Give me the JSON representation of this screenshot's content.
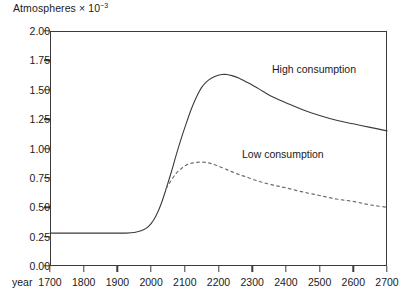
{
  "chart_data": {
    "type": "line",
    "title_base": "Atmospheres × 10",
    "title_exponent": "−3",
    "xlabel": "year",
    "ylabel": "Atmospheres × 10⁻³",
    "xlim": [
      1700,
      2700
    ],
    "ylim": [
      0.0,
      2.0
    ],
    "grid": false,
    "legend_position": "inline-annotations",
    "xticks": [
      1700,
      1800,
      1900,
      2000,
      2100,
      2200,
      2300,
      2400,
      2500,
      2600,
      2700
    ],
    "xtick_labels": [
      "1700",
      "1800",
      "1900",
      "2000",
      "2100",
      "2200",
      "2300",
      "2400",
      "2500",
      "2600",
      "2700"
    ],
    "yticks": [
      0.0,
      0.25,
      0.5,
      0.75,
      1.0,
      1.25,
      1.5,
      1.75,
      2.0
    ],
    "ytick_labels": [
      "0.00",
      "0.25",
      "0.50",
      "0.75",
      "1.00",
      "1.25",
      "1.50",
      "1.75",
      "2.00"
    ],
    "series": [
      {
        "name": "High consumption",
        "style": "solid",
        "color": "#3b3b3b",
        "annotation": "High consumption",
        "x": [
          1700,
          1750,
          1800,
          1850,
          1900,
          1925,
          1950,
          1970,
          1985,
          2000,
          2015,
          2030,
          2045,
          2060,
          2075,
          2090,
          2105,
          2120,
          2135,
          2150,
          2165,
          2180,
          2195,
          2210,
          2225,
          2240,
          2260,
          2280,
          2300,
          2330,
          2360,
          2400,
          2450,
          2500,
          2550,
          2600,
          2650,
          2700
        ],
        "y": [
          0.28,
          0.28,
          0.28,
          0.28,
          0.28,
          0.28,
          0.285,
          0.3,
          0.32,
          0.36,
          0.43,
          0.53,
          0.66,
          0.8,
          0.95,
          1.09,
          1.22,
          1.34,
          1.44,
          1.52,
          1.57,
          1.6,
          1.62,
          1.63,
          1.63,
          1.62,
          1.6,
          1.57,
          1.54,
          1.49,
          1.44,
          1.39,
          1.33,
          1.28,
          1.24,
          1.21,
          1.18,
          1.15
        ]
      },
      {
        "name": "Low consumption",
        "style": "dotted",
        "color": "#6e6e6e",
        "annotation": "Low consumption",
        "x": [
          2045,
          2060,
          2075,
          2090,
          2105,
          2120,
          2135,
          2150,
          2165,
          2180,
          2200,
          2225,
          2250,
          2280,
          2320,
          2360,
          2400,
          2450,
          2500,
          2550,
          2600,
          2650,
          2700
        ],
        "y": [
          0.66,
          0.73,
          0.79,
          0.83,
          0.86,
          0.875,
          0.882,
          0.885,
          0.88,
          0.87,
          0.85,
          0.82,
          0.79,
          0.76,
          0.72,
          0.69,
          0.665,
          0.63,
          0.6,
          0.57,
          0.55,
          0.52,
          0.5
        ]
      }
    ],
    "annotations": [
      {
        "text": "High consumption",
        "x": 2340,
        "y": 1.68
      },
      {
        "text": "Low consumption",
        "x": 2260,
        "y": 0.96
      }
    ]
  },
  "colors": {
    "axis": "#3b3b3b",
    "high_curve": "#3b3b3b",
    "low_curve": "#6e6e6e",
    "text": "#1a1a1a",
    "background": "#ffffff"
  }
}
